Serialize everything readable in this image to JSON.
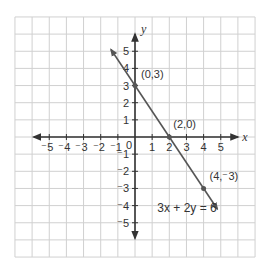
{
  "chart_data": {
    "type": "line",
    "title": "",
    "xlabel": "x",
    "ylabel": "y",
    "xlim": [
      -7,
      7
    ],
    "ylim": [
      -7,
      7
    ],
    "grid": true,
    "x_ticks": [
      "-5",
      "-4",
      "-3",
      "-2",
      "-1",
      "1",
      "2",
      "3",
      "4",
      "5"
    ],
    "y_ticks": [
      "5",
      "4",
      "3",
      "2",
      "1",
      "-1",
      "-2",
      "-3",
      "-4",
      "-5"
    ],
    "origin_label": "0",
    "equation": "3x + 2y = 6",
    "series": [
      {
        "name": "3x + 2y = 6",
        "x": [
          -1.4,
          0,
          2,
          4,
          4.8
        ],
        "y": [
          5.1,
          3,
          0,
          -3,
          -4.2
        ]
      }
    ],
    "points": [
      {
        "x": 0,
        "y": 3,
        "label": "(0,3)"
      },
      {
        "x": 2,
        "y": 0,
        "label": "(2,0)"
      },
      {
        "x": 4,
        "y": -3,
        "label": "(4,⁻3)"
      }
    ],
    "colors": {
      "grid": "#d0d0d0",
      "axes": "#333333",
      "line": "#555555"
    }
  }
}
